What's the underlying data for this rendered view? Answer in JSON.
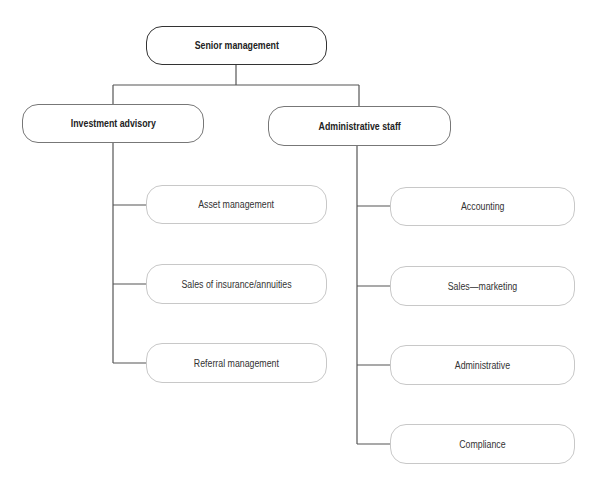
{
  "chart": {
    "root": {
      "label": "Senior management"
    },
    "branches": [
      {
        "label": "Investment advisory",
        "children": [
          {
            "label": "Asset management"
          },
          {
            "label": "Sales of insurance/annuities"
          },
          {
            "label": "Referral management"
          }
        ]
      },
      {
        "label": "Administrative staff",
        "children": [
          {
            "label": "Accounting"
          },
          {
            "label": "Sales—marketing"
          },
          {
            "label": "Administrative"
          },
          {
            "label": "Compliance"
          }
        ]
      }
    ]
  },
  "colors": {
    "root_border": "#333333",
    "branch_border": "#777777",
    "leaf_border": "#c8c8c8",
    "connector": "#555555"
  }
}
